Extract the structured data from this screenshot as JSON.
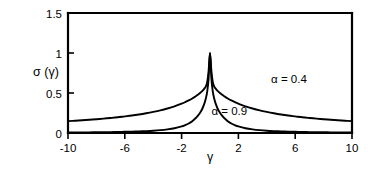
{
  "chart_data": {
    "type": "line",
    "title": "",
    "subtitle": "",
    "xlabel": "γ",
    "ylabel": "σ (γ)",
    "xlim": [
      -10,
      10
    ],
    "ylim": [
      0,
      1.5
    ],
    "xticks": [
      -10,
      -6,
      -2,
      2,
      6,
      10
    ],
    "xtick_labels": [
      "-10",
      "-6",
      "-2",
      "2",
      "6",
      "10"
    ],
    "yticks": [
      0,
      0.5,
      1,
      1.5
    ],
    "ytick_labels": [
      "0",
      "0.5",
      "1",
      "1.5"
    ],
    "grid": false,
    "legend_position": "inline-annotation",
    "background_color": "#ffffff",
    "line_color": "#000000",
    "frame": "left-top-bottom-right",
    "annotations": [
      {
        "text": "α = 0.4",
        "x": 4.3,
        "y": 0.62,
        "series": "alpha_0_4"
      },
      {
        "text": "α = 0.9",
        "x": 0.1,
        "y": 0.22,
        "series": "alpha_0_9"
      }
    ],
    "x": [
      -10,
      -9.5,
      -9,
      -8.5,
      -8,
      -7.5,
      -7,
      -6.5,
      -6,
      -5.5,
      -5,
      -4.5,
      -4,
      -3.5,
      -3,
      -2.5,
      -2,
      -1.75,
      -1.5,
      -1.25,
      -1,
      -0.85,
      -0.7,
      -0.55,
      -0.4,
      -0.3,
      -0.2,
      -0.1,
      0,
      0.1,
      0.2,
      0.3,
      0.4,
      0.55,
      0.7,
      0.85,
      1,
      1.25,
      1.5,
      1.75,
      2,
      2.5,
      3,
      3.5,
      4,
      4.5,
      5,
      5.5,
      6,
      6.5,
      7,
      7.5,
      8,
      8.5,
      9,
      9.5,
      10
    ],
    "series": [
      {
        "name": "alpha_0_4",
        "label": "α = 0.4",
        "alpha": 0.4,
        "peak_value": 1.0,
        "peak_x": 0,
        "values": [
          0.148,
          0.153,
          0.159,
          0.165,
          0.172,
          0.18,
          0.188,
          0.197,
          0.208,
          0.219,
          0.232,
          0.247,
          0.264,
          0.283,
          0.306,
          0.333,
          0.366,
          0.385,
          0.407,
          0.432,
          0.46,
          0.479,
          0.5,
          0.524,
          0.554,
          0.58,
          0.632,
          0.77,
          1.0,
          0.77,
          0.632,
          0.58,
          0.554,
          0.524,
          0.5,
          0.479,
          0.46,
          0.432,
          0.407,
          0.385,
          0.366,
          0.333,
          0.306,
          0.283,
          0.264,
          0.247,
          0.232,
          0.219,
          0.208,
          0.197,
          0.188,
          0.18,
          0.172,
          0.165,
          0.159,
          0.153,
          0.148
        ]
      },
      {
        "name": "alpha_0_9",
        "label": "α = 0.9",
        "alpha": 0.9,
        "peak_value": 1.0,
        "peak_x": 0,
        "values": [
          0.006,
          0.007,
          0.007,
          0.008,
          0.009,
          0.01,
          0.011,
          0.013,
          0.015,
          0.017,
          0.02,
          0.024,
          0.029,
          0.036,
          0.046,
          0.06,
          0.082,
          0.098,
          0.119,
          0.148,
          0.187,
          0.216,
          0.253,
          0.3,
          0.367,
          0.428,
          0.513,
          0.676,
          1.0,
          0.676,
          0.513,
          0.428,
          0.367,
          0.3,
          0.253,
          0.216,
          0.187,
          0.148,
          0.119,
          0.098,
          0.082,
          0.06,
          0.046,
          0.036,
          0.029,
          0.024,
          0.02,
          0.017,
          0.015,
          0.013,
          0.011,
          0.01,
          0.009,
          0.008,
          0.007,
          0.007,
          0.006
        ]
      }
    ]
  }
}
